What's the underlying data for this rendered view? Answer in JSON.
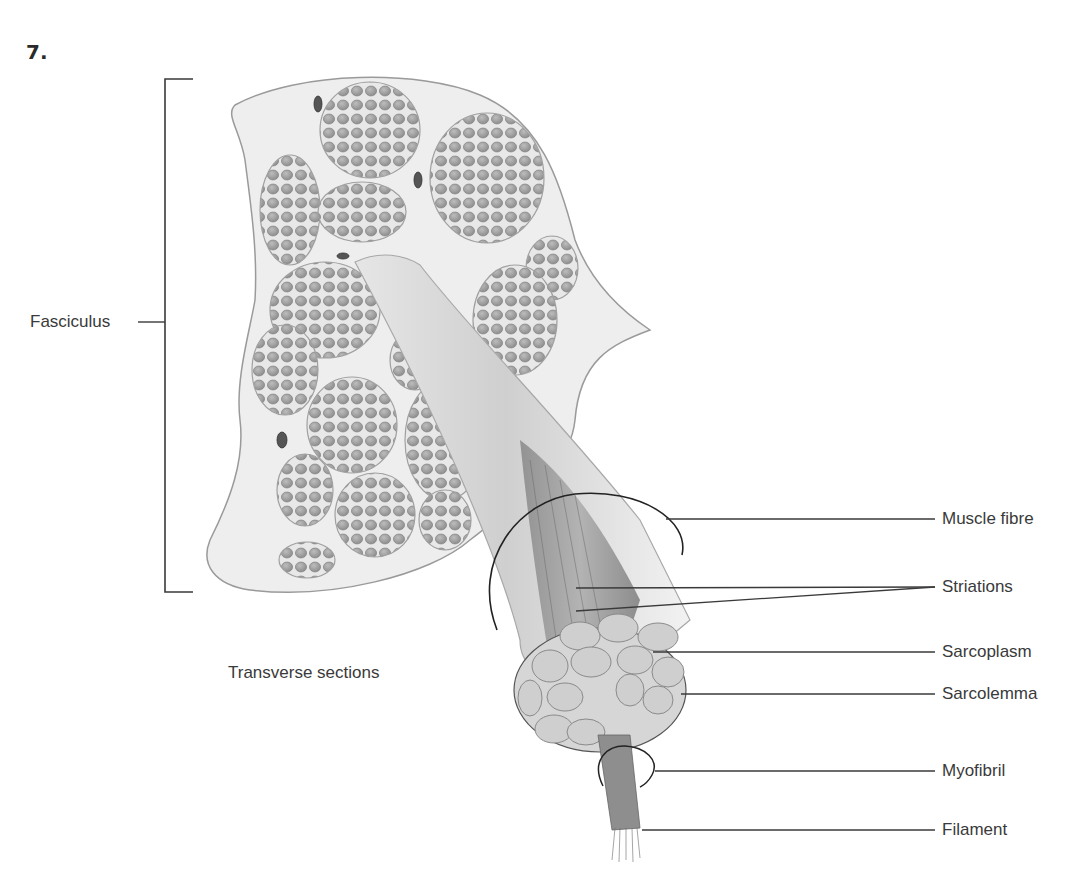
{
  "figure": {
    "number": "7.",
    "title_region": "Structure of skeletal muscle"
  },
  "labels": {
    "fasciculus": "Fasciculus",
    "transverse_sections": "Transverse sections",
    "muscle_fibre": "Muscle fibre",
    "striations": "Striations",
    "sarcoplasm": "Sarcoplasm",
    "sarcolemma": "Sarcolemma",
    "myofibril": "Myofibril",
    "filament": "Filament"
  },
  "colors": {
    "background": "#ffffff",
    "line": "#3a3a3a",
    "tissue_fill": "#ededed",
    "fibre_fill": "#9b9b9b",
    "text": "#3a3a3a"
  }
}
